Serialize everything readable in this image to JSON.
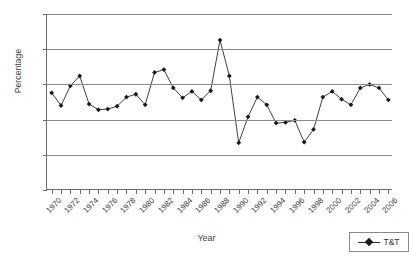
{
  "chart_data": {
    "type": "line",
    "title": "",
    "xlabel": "Year",
    "ylabel": "Percentage",
    "ylim": [
      0,
      250
    ],
    "ytick_values": [
      0,
      50,
      100,
      150,
      200,
      250
    ],
    "grid": true,
    "legend_position": "bottom-right",
    "marker": "diamond",
    "line_color": "#2a2a2a",
    "marker_color": "#1a1a1a",
    "x": [
      1970,
      1971,
      1972,
      1973,
      1974,
      1975,
      1976,
      1977,
      1978,
      1979,
      1980,
      1981,
      1982,
      1983,
      1984,
      1985,
      1986,
      1987,
      1988,
      1989,
      1990,
      1991,
      1992,
      1993,
      1994,
      1995,
      1996,
      1997,
      1998,
      1999,
      2000,
      2001,
      2002,
      2003,
      2004,
      2005,
      2006
    ],
    "xtick_labels": [
      "1970",
      "1972",
      "1974",
      "1976",
      "1978",
      "1980",
      "1982",
      "1984",
      "1986",
      "1988",
      "1990",
      "1992",
      "1994",
      "1996",
      "1998",
      "2000",
      "2002",
      "2004",
      "2006"
    ],
    "series": [
      {
        "name": "T&T",
        "values": [
          138,
          120,
          148,
          162,
          122,
          114,
          115,
          119,
          132,
          136,
          121,
          167,
          171,
          145,
          131,
          140,
          128,
          141,
          213,
          162,
          67,
          104,
          132,
          121,
          95,
          96,
          99,
          68,
          86,
          132,
          140,
          129,
          121,
          145,
          150,
          145,
          128
        ]
      }
    ]
  },
  "legend": {
    "label": "T&T"
  }
}
